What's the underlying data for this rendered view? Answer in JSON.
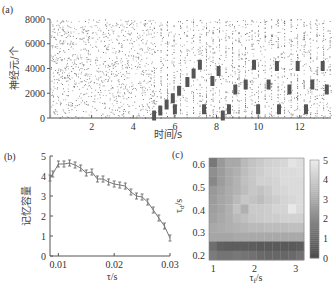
{
  "figure": {
    "panels": [
      {
        "label": "(a)"
      },
      {
        "label": "(b)"
      },
      {
        "label": "(c)"
      }
    ]
  },
  "chart_data": [
    {
      "id": "a",
      "type": "scatter",
      "title": "",
      "xlabel": "时间/s",
      "ylabel": "神经元/个",
      "xlim": [
        0,
        13.5
      ],
      "ylim": [
        0,
        8000
      ],
      "xticks": [
        2,
        4,
        6,
        8,
        10,
        12
      ],
      "yticks": [
        0,
        2000,
        4000,
        6000,
        8000
      ],
      "description": "Spike raster: random background spikes across all neurons; after t≈5 s, sequential dense clusters (memory items) appear as staircase patterns",
      "clusters": [
        {
          "t": 5.0,
          "n": 200
        },
        {
          "t": 5.3,
          "n": 600
        },
        {
          "t": 5.6,
          "n": 1100
        },
        {
          "t": 5.9,
          "n": 1600
        },
        {
          "t": 6.2,
          "n": 2200
        },
        {
          "t": 6.6,
          "n": 2900
        },
        {
          "t": 6.9,
          "n": 3600
        },
        {
          "t": 7.2,
          "n": 4300
        },
        {
          "t": 6.0,
          "n": 700
        },
        {
          "t": 7.4,
          "n": 700
        },
        {
          "t": 7.8,
          "n": 3000
        },
        {
          "t": 8.1,
          "n": 3800
        },
        {
          "t": 8.3,
          "n": 200
        },
        {
          "t": 8.6,
          "n": 700
        },
        {
          "t": 8.9,
          "n": 2300
        },
        {
          "t": 9.4,
          "n": 2700
        },
        {
          "t": 9.8,
          "n": 4300
        },
        {
          "t": 10.0,
          "n": 700
        },
        {
          "t": 10.5,
          "n": 2700
        },
        {
          "t": 10.9,
          "n": 4200
        },
        {
          "t": 11.0,
          "n": 700
        },
        {
          "t": 11.5,
          "n": 2300
        },
        {
          "t": 11.9,
          "n": 4200
        },
        {
          "t": 12.3,
          "n": 700
        },
        {
          "t": 12.6,
          "n": 2700
        },
        {
          "t": 13.1,
          "n": 4200
        },
        {
          "t": 13.3,
          "n": 2300
        }
      ]
    },
    {
      "id": "b",
      "type": "line",
      "title": "",
      "xlabel": "τ/s",
      "ylabel": "记忆容量",
      "xlim": [
        0.0085,
        0.03
      ],
      "ylim": [
        0,
        5
      ],
      "xticks": [
        0.01,
        0.02,
        0.03
      ],
      "yticks": [
        0,
        1,
        2,
        3,
        4,
        5
      ],
      "error_bars": true,
      "x": [
        0.0085,
        0.009,
        0.01,
        0.011,
        0.012,
        0.013,
        0.014,
        0.015,
        0.016,
        0.017,
        0.018,
        0.019,
        0.02,
        0.021,
        0.022,
        0.023,
        0.024,
        0.025,
        0.026,
        0.027,
        0.028,
        0.029,
        0.03
      ],
      "values": [
        3.9,
        4.1,
        4.6,
        4.6,
        4.65,
        4.55,
        4.4,
        4.15,
        4.2,
        3.85,
        3.85,
        3.7,
        3.6,
        3.55,
        3.5,
        3.2,
        3.0,
        2.95,
        2.7,
        2.3,
        1.9,
        1.5,
        0.9
      ]
    },
    {
      "id": "c",
      "type": "heatmap",
      "title": "",
      "xlabel": "τ_f/s",
      "ylabel": "τ_d/s",
      "xlim": [
        0.9,
        3.2
      ],
      "ylim": [
        0.18,
        0.63
      ],
      "xticks": [
        1,
        2,
        3
      ],
      "yticks": [
        0.2,
        0.3,
        0.4,
        0.5,
        0.6
      ],
      "colorbar": {
        "min": 0,
        "max": 5,
        "ticks": [
          0,
          1,
          2,
          3,
          4,
          5
        ]
      },
      "rows_top_to_bottom": [
        [
          1.5,
          2.5,
          3.0,
          3.0,
          3.5,
          3.8,
          4.0,
          4.2,
          4.3,
          4.4,
          4.8,
          4.6
        ],
        [
          2.2,
          2.6,
          3.0,
          3.2,
          3.6,
          3.9,
          4.1,
          4.3,
          4.4,
          4.5,
          4.5,
          4.6
        ],
        [
          2.0,
          2.6,
          3.0,
          3.3,
          3.7,
          3.9,
          4.2,
          4.2,
          4.3,
          4.5,
          4.5,
          4.5
        ],
        [
          2.5,
          2.8,
          3.1,
          3.3,
          3.6,
          3.9,
          3.8,
          4.0,
          4.3,
          4.4,
          4.5,
          4.5
        ],
        [
          2.6,
          2.9,
          3.1,
          3.5,
          3.9,
          3.8,
          3.6,
          3.9,
          4.1,
          4.3,
          4.4,
          4.5
        ],
        [
          2.7,
          2.9,
          3.2,
          3.8,
          3.2,
          4.0,
          4.0,
          4.1,
          4.3,
          4.3,
          4.9,
          4.5
        ],
        [
          2.8,
          3.0,
          3.2,
          3.5,
          3.7,
          3.9,
          4.0,
          4.1,
          4.1,
          4.2,
          4.2,
          4.2
        ],
        [
          3.0,
          3.1,
          3.2,
          3.3,
          3.4,
          3.5,
          3.5,
          3.6,
          3.6,
          3.6,
          3.7,
          3.7
        ],
        [
          2.9,
          2.9,
          2.9,
          3.0,
          3.0,
          3.0,
          3.0,
          3.0,
          3.0,
          3.0,
          3.0,
          3.0
        ],
        [
          1.2,
          0.8,
          0.7,
          0.7,
          0.7,
          0.7,
          0.6,
          0.6,
          0.6,
          0.6,
          0.6,
          0.7
        ],
        [
          1.6,
          1.4,
          1.4,
          1.5,
          1.4,
          1.3,
          1.1,
          1.0,
          1.0,
          1.0,
          1.1,
          1.3
        ]
      ]
    }
  ]
}
